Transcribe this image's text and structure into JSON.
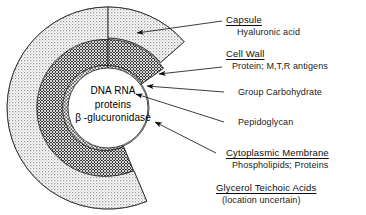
{
  "figure": {
    "background_color": "#ffffff"
  },
  "core": {
    "line1": "DNA RNA",
    "line2": "proteins",
    "line3": "β -glucuronidase"
  },
  "labels": [
    {
      "id": "capsule",
      "primary": "Capsule",
      "secondary": "Hyaluronic acid"
    },
    {
      "id": "cell-wall",
      "primary": "Cell Wall",
      "secondary": "Protein; M,T,R antigens"
    },
    {
      "id": "group-carbohydrate",
      "single": "Group Carbohydrate"
    },
    {
      "id": "pepidoglycan",
      "single": "Pepidoglycan"
    },
    {
      "id": "cytoplasmic-membrane",
      "primary": "Cytoplasmic Membrane",
      "secondary": "Phospholipids; Proteins"
    },
    {
      "id": "glycerol-teichoic-acids",
      "primary": "Glycerol Teichoic Acids",
      "secondary": "(location uncertain)"
    }
  ],
  "layers": [
    {
      "name": "capsule",
      "fill": "stipple-light",
      "color": "#e8e8e8"
    },
    {
      "name": "cell-wall-outer",
      "fill": "crosshatch-dark",
      "color": "#4a4a4a"
    },
    {
      "name": "group-carbohydrate",
      "fill": "crosshatch-light",
      "color": "#d0d0d0"
    },
    {
      "name": "pepidoglycan",
      "fill": "solid-black",
      "color": "#000000"
    },
    {
      "name": "cytoplasmic-membrane",
      "fill": "white-ring",
      "color": "#ffffff"
    },
    {
      "name": "cytoplasm",
      "fill": "white",
      "color": "#ffffff"
    }
  ],
  "colors": {
    "line": "#1a1a1a",
    "text": "#0c0c0c",
    "black_layer": "#000000",
    "dark_hatch": "#3d3d3d",
    "light_hatch": "#cccccc",
    "stipple": "#e5e5e5"
  }
}
